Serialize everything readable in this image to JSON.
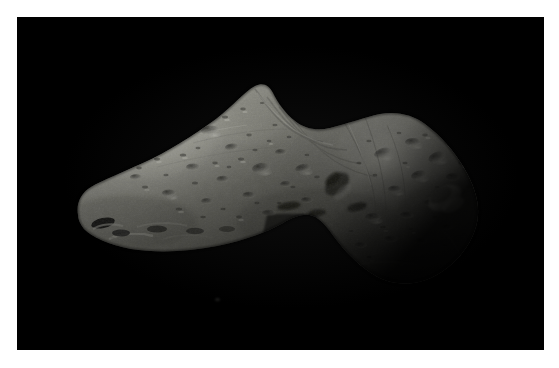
{
  "page": {
    "width": 559,
    "height": 368,
    "background_color": "#ffffff",
    "type": "photograph"
  },
  "photo": {
    "frame": {
      "left": 17,
      "top": 17,
      "width": 527,
      "height": 333,
      "background_color": "#000000",
      "border_color": "#ffffff"
    },
    "subject": "asteroid",
    "subject_description": "Elongated irregular cratered asteroid against black space",
    "lighting": "illuminated from upper left, terminator across lower left tip and lower right limb",
    "palette": {
      "space": "#000000",
      "surface_highlight": "#9a9a96",
      "surface_midtone": "#77776f",
      "surface_shadow": "#2a2a27",
      "terminator": "#101010",
      "frame": "#ffffff"
    },
    "geometry": {
      "bounds_x": [
        75,
        480
      ],
      "bounds_y": [
        85,
        285
      ],
      "left_lobe_peak": [
        255,
        85
      ],
      "left_tip": [
        78,
        215
      ],
      "waist": [
        330,
        200
      ],
      "right_lobe_peak": [
        395,
        115
      ],
      "right_limb": [
        478,
        200
      ],
      "bottom_right": [
        405,
        283
      ]
    }
  },
  "surface_features": {
    "bright_crater_rims": [
      {
        "cx": 445,
        "cy": 198,
        "rx": 17,
        "ry": 10,
        "angle": -28
      },
      {
        "cx": 100,
        "cy": 227,
        "rx": 13,
        "ry": 6,
        "angle": -14
      },
      {
        "cx": 148,
        "cy": 232,
        "rx": 11,
        "ry": 5,
        "angle": -10
      }
    ],
    "dark_craters": [
      {
        "cx": 337,
        "cy": 184,
        "rx": 13,
        "ry": 8,
        "angle": -40
      },
      {
        "cx": 302,
        "cy": 178,
        "rx": 8,
        "ry": 5,
        "angle": -20
      },
      {
        "cx": 287,
        "cy": 205,
        "rx": 10,
        "ry": 4,
        "angle": -8
      },
      {
        "cx": 176,
        "cy": 135,
        "rx": 8,
        "ry": 4,
        "angle": -6
      },
      {
        "cx": 210,
        "cy": 130,
        "rx": 7,
        "ry": 4,
        "angle": -4
      },
      {
        "cx": 261,
        "cy": 168,
        "rx": 7,
        "ry": 4,
        "angle": -8
      }
    ],
    "crater_count_visible": "dozens"
  }
}
